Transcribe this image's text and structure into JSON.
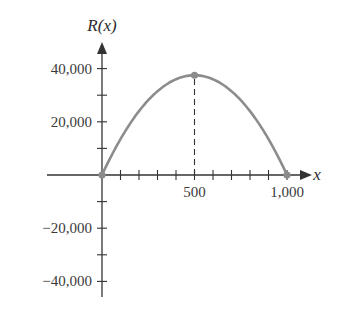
{
  "chart_data": {
    "type": "line",
    "title": "",
    "xlabel": "x",
    "ylabel": "R(x)",
    "function": "R(x) = 150x - 0.15x^2",
    "xlim": [
      -300,
      1100
    ],
    "ylim": [
      -45000,
      50000
    ],
    "x_ticks": [
      100,
      200,
      300,
      400,
      500,
      600,
      700,
      800,
      900,
      1000
    ],
    "x_tick_labels": [
      "500",
      "1,000"
    ],
    "x_tick_label_values": [
      500,
      1000
    ],
    "y_ticks": [
      -40000,
      -30000,
      -20000,
      -10000,
      10000,
      20000,
      30000,
      40000
    ],
    "y_tick_labels": [
      "40,000",
      "20,000",
      "−20,000",
      "−40,000"
    ],
    "y_tick_label_values": [
      40000,
      20000,
      -20000,
      -40000
    ],
    "grid": false,
    "series": [
      {
        "name": "R(x)",
        "x": [
          0,
          100,
          200,
          300,
          400,
          500,
          600,
          700,
          800,
          900,
          1000
        ],
        "values": [
          0,
          13500,
          24000,
          31500,
          36000,
          37500,
          36000,
          31500,
          24000,
          13500,
          0
        ]
      }
    ],
    "points": [
      {
        "x": 0,
        "y": 0,
        "label": "origin"
      },
      {
        "x": 500,
        "y": 37500,
        "label": "vertex"
      },
      {
        "x": 1000,
        "y": 0,
        "label": "x-intercept"
      }
    ],
    "annotations": [
      {
        "type": "dashed-vertical-line",
        "x": 500,
        "from_y": 0,
        "to_y": 37500
      }
    ],
    "colors": {
      "axes": "#333333",
      "curve": "#8c8c8c",
      "points": "#8c8c8c"
    }
  }
}
